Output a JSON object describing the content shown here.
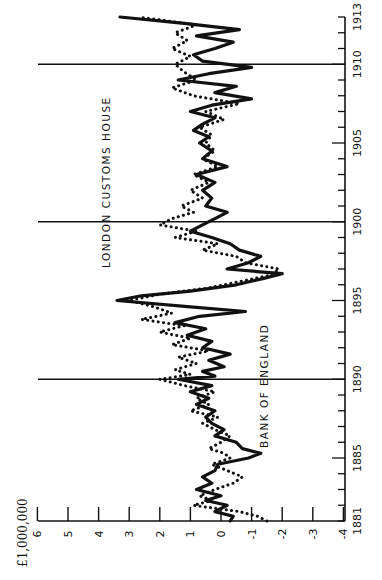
{
  "chart_data": {
    "type": "line",
    "orientation": "rotated-90-ccw",
    "title": "",
    "ylabel": "£1,000,000",
    "xlabel": "",
    "xlim": [
      1881,
      1913
    ],
    "ylim": [
      -4,
      6
    ],
    "x_major_ticks": [
      1881,
      1885,
      1890,
      1895,
      1900,
      1905,
      1910,
      1913
    ],
    "y_ticks": [
      6,
      5,
      4,
      3,
      2,
      1,
      0,
      -1,
      -2,
      -3,
      -4
    ],
    "y_tick_labels": [
      "6",
      "5",
      "4",
      "3",
      "2",
      "1",
      "0",
      "-1",
      "-2",
      "-3",
      "-4"
    ],
    "vertical_reference_lines": [
      1890,
      1900,
      1910
    ],
    "grid": false,
    "annotations": [
      "BANK OF ENGLAND",
      "LONDON CUSTOMS HOUSE"
    ],
    "series": [
      {
        "name": "Bank of England",
        "style": "solid",
        "x": [
          1881.0,
          1881.3,
          1881.6,
          1882.0,
          1882.3,
          1882.6,
          1883.0,
          1883.4,
          1883.8,
          1884.2,
          1884.6,
          1885.0,
          1885.3,
          1885.6,
          1886.0,
          1886.4,
          1886.8,
          1887.2,
          1887.6,
          1888.0,
          1888.4,
          1888.8,
          1889.2,
          1889.6,
          1890.0,
          1890.2,
          1890.5,
          1890.8,
          1891.2,
          1891.6,
          1892.0,
          1892.4,
          1892.8,
          1893.2,
          1893.6,
          1894.0,
          1894.3,
          1894.6,
          1895.0,
          1895.3,
          1895.6,
          1896.0,
          1896.4,
          1896.7,
          1897.0,
          1897.4,
          1897.8,
          1898.2,
          1898.6,
          1899.0,
          1899.4,
          1899.8,
          1900.2,
          1900.6,
          1901.0,
          1901.5,
          1902.0,
          1902.5,
          1903.0,
          1903.5,
          1904.0,
          1904.5,
          1905.0,
          1905.4,
          1905.8,
          1906.2,
          1906.6,
          1907.0,
          1907.4,
          1907.8,
          1908.2,
          1908.6,
          1909.0,
          1909.4,
          1909.8,
          1910.2,
          1910.6,
          1911.0,
          1911.4,
          1911.8,
          1912.2,
          1912.6,
          1913.0
        ],
        "values": [
          -0.3,
          -0.4,
          0.2,
          -0.2,
          0.5,
          0.0,
          0.8,
          0.3,
          0.6,
          0.2,
          0.1,
          -0.9,
          -1.3,
          -0.7,
          -0.5,
          0.2,
          -0.1,
          0.3,
          0.5,
          0.2,
          0.8,
          0.4,
          1.0,
          0.3,
          1.4,
          0.2,
          0.6,
          -0.1,
          0.4,
          -0.3,
          0.6,
          0.3,
          1.1,
          0.5,
          1.5,
          0.7,
          -0.8,
          1.0,
          3.4,
          2.6,
          1.0,
          -0.5,
          -1.4,
          -2.0,
          -0.2,
          -0.9,
          -1.3,
          -0.6,
          -0.3,
          0.3,
          1.0,
          0.6,
          0.2,
          -0.2,
          0.5,
          0.3,
          0.6,
          0.2,
          0.8,
          -0.2,
          0.6,
          0.3,
          0.7,
          0.4,
          0.9,
          0.6,
          0.2,
          1.0,
          0.3,
          -1.0,
          0.2,
          -0.5,
          1.4,
          0.4,
          -1.0,
          0.6,
          0.9,
          0.2,
          -0.4,
          0.8,
          -0.6,
          1.2,
          3.3
        ]
      },
      {
        "name": "London Customs House",
        "style": "dotted",
        "x": [
          1881.0,
          1881.3,
          1881.6,
          1882.0,
          1882.3,
          1882.6,
          1883.0,
          1883.4,
          1883.8,
          1884.2,
          1884.6,
          1885.0,
          1885.3,
          1885.6,
          1886.0,
          1886.4,
          1886.8,
          1887.2,
          1887.6,
          1888.0,
          1888.4,
          1888.8,
          1889.2,
          1889.6,
          1890.0,
          1890.3,
          1890.6,
          1891.0,
          1891.4,
          1891.8,
          1892.2,
          1892.6,
          1893.0,
          1893.4,
          1893.8,
          1894.2,
          1894.6,
          1895.0,
          1895.4,
          1895.8,
          1896.2,
          1896.6,
          1897.0,
          1897.4,
          1897.8,
          1898.2,
          1898.6,
          1899.0,
          1899.4,
          1899.8,
          1900.2,
          1900.6,
          1901.0,
          1901.5,
          1902.0,
          1902.5,
          1903.0,
          1903.5,
          1904.0,
          1904.5,
          1905.0,
          1905.5,
          1906.0,
          1906.5,
          1907.0,
          1907.5,
          1908.0,
          1908.5,
          1909.0,
          1909.5,
          1910.0,
          1910.5,
          1911.0,
          1911.5,
          1912.0,
          1912.5,
          1913.0
        ],
        "values": [
          -1.5,
          -1.2,
          -0.6,
          0.9,
          0.3,
          0.7,
          0.2,
          -0.4,
          -0.7,
          -0.2,
          0.3,
          -0.3,
          -0.1,
          0.4,
          0.0,
          -0.3,
          0.2,
          0.6,
          0.1,
          1.0,
          0.4,
          0.8,
          0.2,
          1.2,
          2.0,
          1.0,
          1.5,
          0.8,
          1.4,
          0.4,
          1.6,
          1.0,
          2.0,
          1.2,
          2.6,
          1.6,
          2.2,
          3.0,
          2.0,
          0.4,
          -0.6,
          -1.6,
          -1.9,
          -0.8,
          -0.5,
          0.6,
          0.1,
          1.5,
          0.8,
          2.0,
          1.6,
          0.9,
          1.3,
          0.6,
          1.0,
          0.4,
          0.9,
          0.1,
          0.6,
          0.2,
          0.5,
          0.3,
          0.7,
          -0.1,
          0.5,
          -0.6,
          0.9,
          1.6,
          0.8,
          1.2,
          1.5,
          1.0,
          1.6,
          1.1,
          1.5,
          0.8,
          2.7
        ]
      }
    ]
  },
  "labels": {
    "unit": "£1,000,000",
    "bank": "BANK OF ENGLAND",
    "customs": "LONDON CUSTOMS HOUSE"
  },
  "axis": {
    "value_labels": [
      "6",
      "5",
      "4",
      "3",
      "2",
      "1",
      "0",
      "-1",
      "-2",
      "-3",
      "-4"
    ],
    "year_labels": [
      "1881",
      "1885",
      "1890",
      "1895",
      "1900",
      "1905",
      "1910",
      "1913"
    ]
  }
}
